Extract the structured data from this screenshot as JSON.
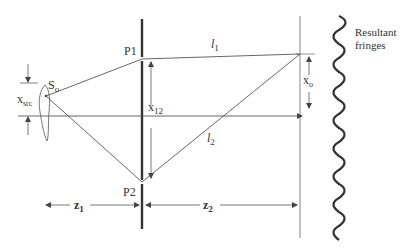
{
  "diagram": {
    "labels": {
      "source": "S",
      "source_sub": "o",
      "p1": "P1",
      "p2": "P2",
      "l1": "l",
      "l1_sub": "1",
      "l2": "l",
      "l2_sub": "2",
      "x12": "x",
      "x12_sub": "12",
      "xo": "x",
      "xo_sub": "o",
      "xsrc": "x",
      "xsrc_sub": "src",
      "z1": "z",
      "z1_sub": "1",
      "z2": "z",
      "z2_sub": "2",
      "fringes_line1": "Resultant",
      "fringes_line2": "fringes"
    },
    "colors": {
      "line": "#555555",
      "plane": "#333333",
      "screen": "#999999",
      "text": "#333333"
    }
  }
}
